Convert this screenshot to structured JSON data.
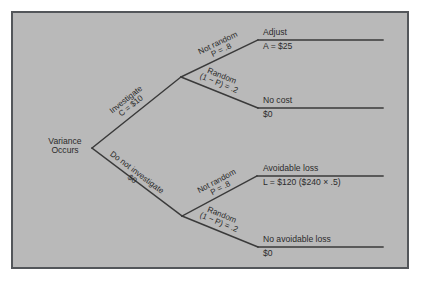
{
  "figure": {
    "background_color": "#ffffff",
    "panel_color": "#b9b9b9",
    "border_color": "#53565a",
    "line_color": "#3a3a3a",
    "text_color": "#2b2b2b",
    "type": "decision-tree"
  },
  "tree": {
    "root": {
      "line1": "Variance",
      "line2": "Occurs"
    },
    "decision_branches": [
      {
        "id": "investigate",
        "line1": "Investigate",
        "line2": "C = $10"
      },
      {
        "id": "do-not-investigate",
        "line1": "Do not investigate",
        "line2": "$0"
      }
    ],
    "chance_branches": [
      {
        "id": "investigate-not-random",
        "line1": "Not random",
        "line2": "P = .8"
      },
      {
        "id": "investigate-random",
        "line1": "Random",
        "line2": "(1 − P) = .2"
      },
      {
        "id": "no-investigate-not-random",
        "line1": "Not random",
        "line2": "P = .8"
      },
      {
        "id": "no-investigate-random",
        "line1": "Random",
        "line2": "(1 − P) = .2"
      }
    ],
    "outcomes": [
      {
        "id": "adjust",
        "title": "Adjust",
        "value": "A = $25"
      },
      {
        "id": "no-cost",
        "title": "No cost",
        "value": "$0"
      },
      {
        "id": "avoidable-loss",
        "title": "Avoidable loss",
        "value": "L = $120 ($240 × .5)"
      },
      {
        "id": "no-avoidable-loss",
        "title": "No avoidable loss",
        "value": "$0"
      }
    ]
  }
}
